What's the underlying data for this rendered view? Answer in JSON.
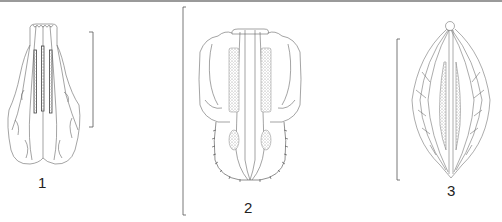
{
  "figure": {
    "type": "botanical-line-drawing",
    "panels": [
      {
        "label": "1",
        "subject": "obovate-petal-with-three-dark-veins",
        "scale_bar": "right"
      },
      {
        "label": "2",
        "subject": "lobed-structure-with-central-keel-and-stippled-patches",
        "scale_bar": "left"
      },
      {
        "label": "3",
        "subject": "lanceolate-elliptic-structure-with-stippled-center",
        "scale_bar": "left"
      }
    ]
  },
  "colors": {
    "line": "#555555",
    "stipple": "#8a8a8a",
    "topbar": "#9a9a9a",
    "background": "#ffffff"
  }
}
